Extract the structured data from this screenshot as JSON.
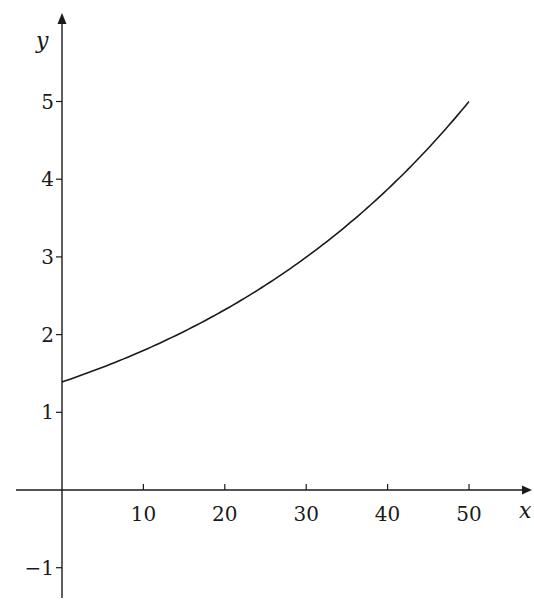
{
  "chart_data": {
    "type": "line",
    "title": "",
    "xlabel": "x",
    "ylabel": "y",
    "xlim": [
      -5,
      57
    ],
    "ylim": [
      -1.5,
      5.5
    ],
    "grid": false,
    "legend": null,
    "x_ticks": [
      10,
      20,
      30,
      40,
      50
    ],
    "x_tick_labels": [
      "10",
      "20",
      "30",
      "40",
      "50"
    ],
    "y_ticks": [
      -1,
      1,
      2,
      3,
      4,
      5
    ],
    "y_tick_labels": [
      "−1",
      "1",
      "2",
      "3",
      "4",
      "5"
    ],
    "series": [
      {
        "name": "curve",
        "description": "exponential growth from about 1.39 at x=0 to 5 at x=50",
        "x": [
          0,
          5,
          10,
          15,
          20,
          25,
          30,
          35,
          40,
          45,
          50
        ],
        "y": [
          1.39,
          1.58,
          1.8,
          2.04,
          2.32,
          2.64,
          3.0,
          3.41,
          3.87,
          4.4,
          5.0
        ]
      }
    ]
  },
  "layout": {
    "origin_px": [
      62,
      490
    ],
    "px_per_x_unit": 8.14,
    "px_per_y_unit": 77.7,
    "x_axis_px": [
      16,
      530
    ],
    "y_axis_px": [
      598,
      14
    ]
  }
}
